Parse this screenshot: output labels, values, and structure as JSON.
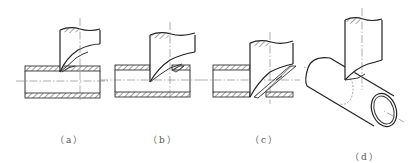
{
  "figure": {
    "panels": [
      {
        "id": "a",
        "label": "（a）",
        "description": "cutter entering top wall of pipe"
      },
      {
        "id": "b",
        "label": "（b）",
        "description": "cutter through top wall of pipe"
      },
      {
        "id": "c",
        "label": "（c）",
        "description": "cutter through both walls of pipe"
      },
      {
        "id": "d",
        "label": "（d）",
        "description": "isometric view of cutter and pipe"
      }
    ]
  }
}
